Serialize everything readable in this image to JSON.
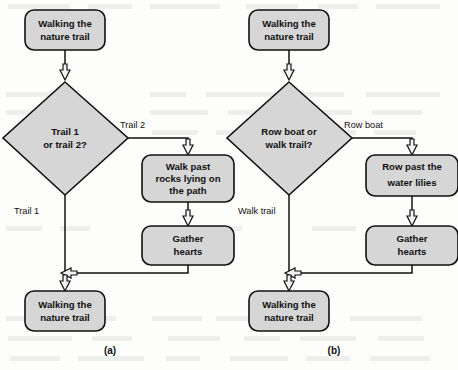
{
  "figure": {
    "caption_a": "(a)",
    "caption_b": "(b)",
    "colors": {
      "shape_fill": "#d6d6d6",
      "shape_stroke": "#111111",
      "arrow_fill": "#f2f2f2",
      "page_background": "#fdfdfc"
    }
  },
  "diagram_a": {
    "id": "a",
    "nodes": {
      "start": {
        "type": "terminator",
        "text_line1": "Walking the",
        "text_line2": "nature trail"
      },
      "decision": {
        "type": "decision",
        "text_line1": "Trail 1",
        "text_line2": "or trail 2?"
      },
      "process1": {
        "type": "process",
        "text_line1": "Walk past",
        "text_line2": "rocks lying on",
        "text_line3": "the path"
      },
      "process2": {
        "type": "process",
        "text_line1": "Gather",
        "text_line2": "hearts"
      },
      "end": {
        "type": "terminator",
        "text_line1": "Walking the",
        "text_line2": "nature trail"
      }
    },
    "edge_labels": {
      "branch_right": "Trail 2",
      "branch_down": "Trail 1"
    }
  },
  "diagram_b": {
    "id": "b",
    "nodes": {
      "start": {
        "type": "terminator",
        "text_line1": "Walking the",
        "text_line2": "nature trail"
      },
      "decision": {
        "type": "decision",
        "text_line1": "Row boat or",
        "text_line2": "walk trail?"
      },
      "process1": {
        "type": "process",
        "text_line1": "Row past the",
        "text_line2": "water lilies"
      },
      "process2": {
        "type": "process",
        "text_line1": "Gather",
        "text_line2": "hearts"
      },
      "end": {
        "type": "terminator",
        "text_line1": "Walking the",
        "text_line2": "nature trail"
      }
    },
    "edge_labels": {
      "branch_right": "Row boat",
      "branch_down": "Walk trail"
    }
  }
}
